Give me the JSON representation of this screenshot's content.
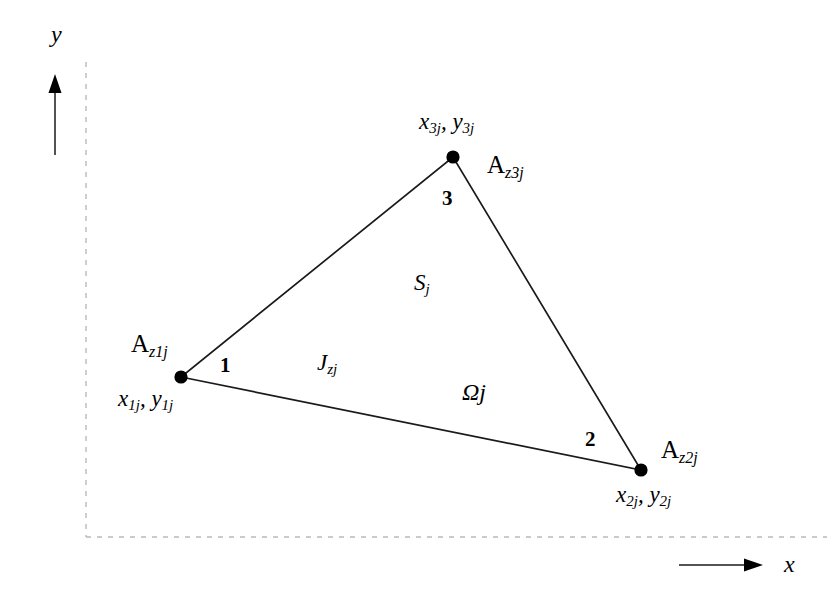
{
  "figure": {
    "type": "diagram",
    "background_color": "#ffffff",
    "line_color": "#1a1a1a",
    "dashed_border_color": "#b8b8c0",
    "axes": {
      "y_label": "y",
      "x_label": "x",
      "y_arrow": {
        "x": 55,
        "y_start": 155,
        "y_end": 78
      },
      "x_arrow": {
        "y": 565,
        "x_start": 679,
        "x_end": 761
      }
    },
    "plot_frame": {
      "left": 86,
      "top": 62,
      "bottom": 537,
      "right": 827,
      "style": "dashed"
    },
    "triangle": {
      "stroke_width": 1.6,
      "vertices": [
        {
          "id": "1",
          "number_label": "1",
          "x": 181,
          "y": 377
        },
        {
          "id": "2",
          "number_label": "2",
          "x": 641,
          "y": 470
        },
        {
          "id": "3",
          "number_label": "3",
          "x": 453,
          "y": 157
        }
      ],
      "node_radius": 6.5
    },
    "labels": {
      "vertex3_coords": {
        "var1": "x",
        "sub1": "3j",
        "sep": ", ",
        "var2": "y",
        "sub2": "3j"
      },
      "vertex1_coords": {
        "var1": "x",
        "sub1": "1j",
        "sep": ", ",
        "var2": "y",
        "sub2": "1j"
      },
      "vertex2_coords": {
        "var1": "x",
        "sub1": "2j",
        "sep": ", ",
        "var2": "y",
        "sub2": "2j"
      },
      "az1j": {
        "base": "A",
        "sub": "z1j"
      },
      "az2j": {
        "base": "A",
        "sub": "z2j"
      },
      "az3j": {
        "base": "A",
        "sub": "z3j"
      },
      "vertex_number_1": "1",
      "vertex_number_2": "2",
      "vertex_number_3": "3",
      "surface": {
        "base": "S",
        "sub": "j"
      },
      "current_density": {
        "base": "J",
        "sub": "zj"
      },
      "domain": {
        "base": "Ω",
        "sub": "j"
      }
    }
  }
}
